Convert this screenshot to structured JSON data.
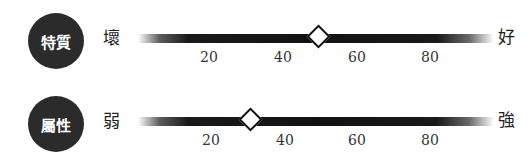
{
  "scales": [
    {
      "badge": "特質",
      "left_label": "壞",
      "right_label": "好",
      "value": 50,
      "ticks": [
        "20",
        "40",
        "60",
        "80"
      ]
    },
    {
      "badge": "屬性",
      "left_label": "弱",
      "right_label": "強",
      "value": 31,
      "ticks": [
        "20",
        "40",
        "60",
        "80"
      ]
    }
  ],
  "colors": {
    "badge_bg": "#2b2b2b",
    "bar": "#111111",
    "marker_fill": "#ffffff"
  }
}
